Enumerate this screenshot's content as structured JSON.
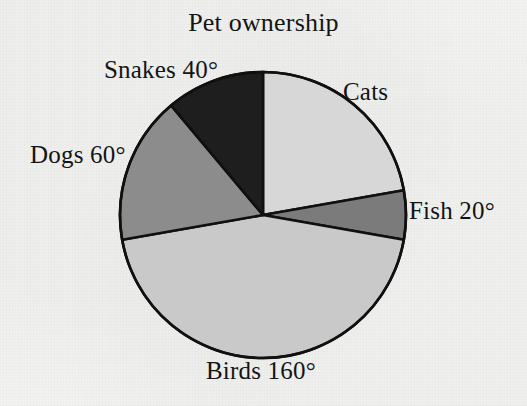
{
  "chart_data": {
    "type": "pie",
    "title": "Pet ownership",
    "xlabel": "",
    "ylabel": "",
    "unit": "degrees",
    "total_degrees": 360,
    "start_angle_deg": 0,
    "direction": "clockwise",
    "legend_position": "outside-labels",
    "grid": false,
    "categories": [
      "Cats",
      "Fish",
      "Birds",
      "Dogs",
      "Snakes"
    ],
    "values": [
      80,
      20,
      160,
      60,
      40
    ],
    "labels": [
      "Cats",
      "Fish 20°",
      "Birds 160°",
      "Dogs 60°",
      "Snakes 40°"
    ],
    "slices": [
      {
        "name": "Cats",
        "label": "Cats",
        "value_deg": 80,
        "value_shown": false,
        "start_deg": 0,
        "end_deg": 80,
        "color": "#d7d7d7"
      },
      {
        "name": "Fish",
        "label": "Fish 20°",
        "value_deg": 20,
        "value_shown": true,
        "start_deg": 80,
        "end_deg": 100,
        "color": "#7b7b7b"
      },
      {
        "name": "Birds",
        "label": "Birds 160°",
        "value_deg": 160,
        "value_shown": true,
        "start_deg": 100,
        "end_deg": 260,
        "color": "#c9c9c9"
      },
      {
        "name": "Dogs",
        "label": "Dogs 60°",
        "value_deg": 60,
        "value_shown": true,
        "start_deg": 260,
        "end_deg": 320,
        "color": "#8c8c8c"
      },
      {
        "name": "Snakes",
        "label": "Snakes 40°",
        "value_deg": 40,
        "value_shown": true,
        "start_deg": 320,
        "end_deg": 360,
        "color": "#1e1e1e"
      }
    ],
    "geometry": {
      "center_x": 263,
      "center_y": 215,
      "radius": 143,
      "outline_color": "#101010",
      "outline_width": 2.6
    },
    "background_color": "#f4f4f2",
    "text_color": "#141414"
  }
}
